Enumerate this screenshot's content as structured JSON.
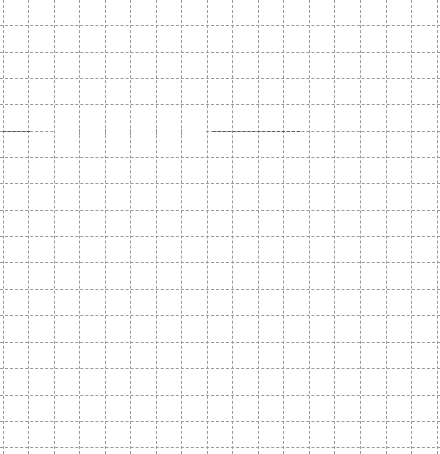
{
  "canvas": {
    "width": 440,
    "height": 454,
    "background": "#ffffff"
  },
  "grid": {
    "line_color": "#9a9a9a",
    "line_style": "dashed",
    "vertical_x": [
      3,
      28,
      54,
      79,
      105,
      130,
      156,
      181,
      207,
      232,
      258,
      283,
      309,
      334,
      360,
      386,
      411,
      437
    ],
    "horizontal_y": [
      25,
      52,
      78,
      104,
      131,
      157,
      183,
      210,
      236,
      262,
      289,
      315,
      342,
      368,
      395,
      421,
      447
    ]
  },
  "highlight_row": {
    "y": 131,
    "color": "#555555",
    "dark_segments": [
      [
        3,
        30
      ],
      [
        213,
        300
      ]
    ],
    "missing_span": [
      55,
      205
    ]
  }
}
